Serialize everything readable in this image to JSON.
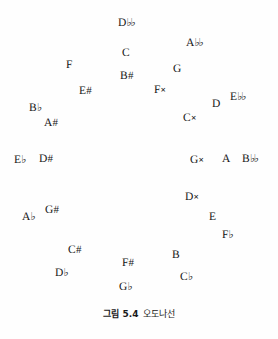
{
  "figure": {
    "caption_number": "그림 5.4",
    "caption_text": "오도나선",
    "background_color": "#fefefe",
    "text_color": "#151515",
    "width": 278,
    "height": 339
  },
  "notes": [
    {
      "id": "d-double-flat",
      "text": "D♭♭",
      "base": "D",
      "accidental": "double-flat",
      "x": 118,
      "y": 18
    },
    {
      "id": "a-double-flat",
      "text": "A♭♭",
      "base": "A",
      "accidental": "double-flat",
      "x": 186,
      "y": 38
    },
    {
      "id": "c-natural",
      "text": "C",
      "base": "C",
      "accidental": "natural",
      "x": 122,
      "y": 48
    },
    {
      "id": "f-natural",
      "text": "F",
      "base": "F",
      "accidental": "natural",
      "x": 66,
      "y": 60
    },
    {
      "id": "g-natural",
      "text": "G",
      "base": "G",
      "accidental": "natural",
      "x": 173,
      "y": 64
    },
    {
      "id": "b-sharp",
      "text": "B#",
      "base": "B",
      "accidental": "sharp",
      "x": 120,
      "y": 71
    },
    {
      "id": "e-sharp",
      "text": "E#",
      "base": "E",
      "accidental": "sharp",
      "x": 79,
      "y": 86
    },
    {
      "id": "f-double-sharp",
      "text": "F×",
      "base": "F",
      "accidental": "double-sharp",
      "x": 154,
      "y": 85
    },
    {
      "id": "d-natural",
      "text": "D",
      "base": "D",
      "accidental": "natural",
      "x": 212,
      "y": 99
    },
    {
      "id": "e-double-flat",
      "text": "E♭♭",
      "base": "E",
      "accidental": "double-flat",
      "x": 230,
      "y": 92
    },
    {
      "id": "b-flat",
      "text": "B♭",
      "base": "B",
      "accidental": "flat",
      "x": 29,
      "y": 103
    },
    {
      "id": "c-double-sharp",
      "text": "C×",
      "base": "C",
      "accidental": "double-sharp",
      "x": 183,
      "y": 113
    },
    {
      "id": "a-sharp",
      "text": "A#",
      "base": "A",
      "accidental": "sharp",
      "x": 44,
      "y": 118
    },
    {
      "id": "e-flat",
      "text": "E♭",
      "base": "E",
      "accidental": "flat",
      "x": 14,
      "y": 155
    },
    {
      "id": "d-sharp",
      "text": "D#",
      "base": "D",
      "accidental": "sharp",
      "x": 39,
      "y": 154
    },
    {
      "id": "g-double-sharp",
      "text": "G×",
      "base": "G",
      "accidental": "double-sharp",
      "x": 190,
      "y": 155
    },
    {
      "id": "a-natural",
      "text": "A",
      "base": "A",
      "accidental": "natural",
      "x": 222,
      "y": 154
    },
    {
      "id": "b-double-flat",
      "text": "B♭♭",
      "base": "B",
      "accidental": "double-flat",
      "x": 242,
      "y": 154
    },
    {
      "id": "d-double-sharp",
      "text": "D×",
      "base": "D",
      "accidental": "double-sharp",
      "x": 185,
      "y": 192
    },
    {
      "id": "e-natural",
      "text": "E",
      "base": "E",
      "accidental": "natural",
      "x": 209,
      "y": 212
    },
    {
      "id": "a-flat",
      "text": "A♭",
      "base": "A",
      "accidental": "flat",
      "x": 22,
      "y": 212
    },
    {
      "id": "g-sharp",
      "text": "G#",
      "base": "G",
      "accidental": "sharp",
      "x": 45,
      "y": 205
    },
    {
      "id": "f-flat",
      "text": "F♭",
      "base": "F",
      "accidental": "flat",
      "x": 222,
      "y": 230
    },
    {
      "id": "c-sharp",
      "text": "C#",
      "base": "C",
      "accidental": "sharp",
      "x": 68,
      "y": 245
    },
    {
      "id": "b-natural",
      "text": "B",
      "base": "B",
      "accidental": "natural",
      "x": 172,
      "y": 250
    },
    {
      "id": "f-sharp",
      "text": "F#",
      "base": "F",
      "accidental": "sharp",
      "x": 122,
      "y": 258
    },
    {
      "id": "d-flat",
      "text": "D♭",
      "base": "D",
      "accidental": "flat",
      "x": 55,
      "y": 268
    },
    {
      "id": "c-flat",
      "text": "C♭",
      "base": "C",
      "accidental": "flat",
      "x": 180,
      "y": 272
    },
    {
      "id": "g-flat",
      "text": "G♭",
      "base": "G",
      "accidental": "flat",
      "x": 119,
      "y": 282
    }
  ]
}
